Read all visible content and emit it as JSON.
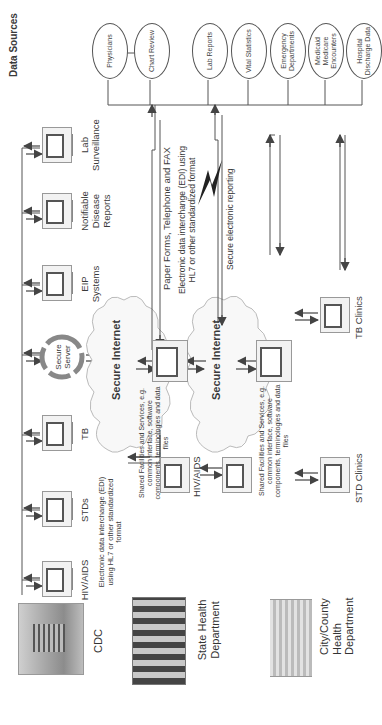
{
  "orientation": "rotated 90 degrees counter-clockwise",
  "data_sources": {
    "header": "Data Sources",
    "items": [
      "Physicians",
      "Chart Review",
      "Lab Reports",
      "Vital Statistics",
      "Emergency Departments",
      "Medicaid Medicare Encounters",
      "Hospital Discharge Data"
    ]
  },
  "cdc": {
    "label": "CDC",
    "systems": [
      "HIV/AIDS",
      "STDs",
      "TB",
      "Secure Server",
      "EIP Systems",
      "Notifiable Disease Reports",
      "Lab Surveillance"
    ],
    "edi_note": "Electronic data interchange (EDI) using HL7 or other standardized format"
  },
  "state": {
    "label": "State Health Department",
    "system_label": "HIV/AIDS",
    "shared_note": "Shared Facilities and Services, e.g. common interface, software components, terminologies and data files"
  },
  "county": {
    "label": "City/County Health Department",
    "shared_note": "Shared Facilities and Services, e.g. common interface, software components, terminologies and data files",
    "clinics": [
      "STD Clinics",
      "TB Clinics"
    ]
  },
  "network": {
    "internet_label": "Secure Internet",
    "paper_label": "Paper Forms, Telephone and FAX",
    "edi_label": "Electronic data interchange (EDI) using HL7 or other standardized format",
    "secure_reporting": "Secure electronic reporting"
  },
  "colors": {
    "line": "#555555",
    "text": "#333333",
    "cloud": "#f7f7f7",
    "server_ring": "#777777"
  }
}
